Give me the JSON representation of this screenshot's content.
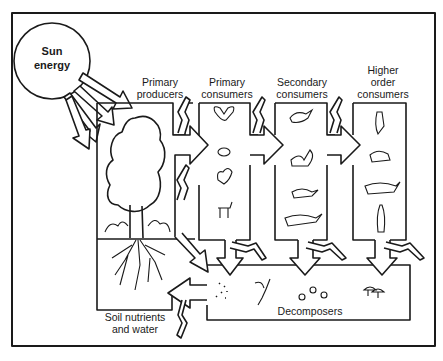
{
  "diagram": {
    "sun": {
      "label_line1": "Sun",
      "label_line2": "energy"
    },
    "nodes": {
      "primary_producers": {
        "line1": "Primary",
        "line2": "producers"
      },
      "primary_consumers": {
        "line1": "Primary",
        "line2": "consumers",
        "icons": [
          "butterfly",
          "mouse",
          "squirrel",
          "deer"
        ]
      },
      "secondary_consumers": {
        "line1": "Secondary",
        "line2": "consumers",
        "icons": [
          "bird",
          "skunk",
          "raccoon",
          "fox"
        ]
      },
      "higher_consumers": {
        "line1": "Higher",
        "line2": "order",
        "line3": "consumers",
        "icons": [
          "owl",
          "bobcat",
          "wolf",
          "human"
        ]
      },
      "soil": {
        "line1": "Soil nutrients",
        "line2": "and water"
      },
      "decomposers": {
        "label": "Decomposers",
        "icons": [
          "bacteria",
          "worms",
          "beetles",
          "mushrooms"
        ]
      }
    },
    "colors": {
      "line": "#1a1a1a",
      "background": "#ffffff"
    }
  }
}
